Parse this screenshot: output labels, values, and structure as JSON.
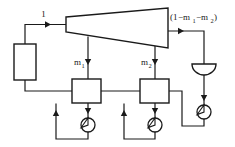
{
  "diagram": {
    "stroke_color": "#1a1a1a",
    "fill_color": "#ffffff",
    "background_color": "#ffffff",
    "labels": {
      "inlet_flow": "1",
      "extraction_1_base": "m",
      "extraction_1_sub": "1",
      "extraction_2_base": "m",
      "extraction_2_sub": "2",
      "exit_open_paren": "(1",
      "exit_minus_1": "−m",
      "exit_sub_1": "1",
      "exit_minus_2": "−m",
      "exit_sub_2": "2",
      "exit_close_paren": ")"
    },
    "components": [
      {
        "id": "boiler",
        "name": "boiler",
        "shape": "rectangle"
      },
      {
        "id": "turbine",
        "name": "turbine",
        "shape": "trapezoid"
      },
      {
        "id": "feedwater-heater-1",
        "name": "open feedwater heater 1",
        "shape": "rectangle"
      },
      {
        "id": "feedwater-heater-2",
        "name": "open feedwater heater 2",
        "shape": "rectangle"
      },
      {
        "id": "condenser",
        "name": "condenser",
        "shape": "half-disc"
      },
      {
        "id": "pump-1",
        "name": "pump 1",
        "shape": "circle"
      },
      {
        "id": "pump-2",
        "name": "pump 2",
        "shape": "circle"
      },
      {
        "id": "pump-3",
        "name": "condensate pump",
        "shape": "circle"
      }
    ],
    "streams": [
      {
        "id": "boiler-to-turbine",
        "label": "1"
      },
      {
        "id": "turbine-extraction-1",
        "label": "m1"
      },
      {
        "id": "turbine-extraction-2",
        "label": "m2"
      },
      {
        "id": "turbine-to-condenser",
        "label": "(1-m1-m2)"
      }
    ]
  }
}
